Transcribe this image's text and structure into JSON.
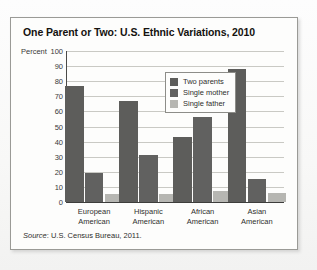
{
  "figure": {
    "title": "One Parent or Two: U.S. Ethnic Variations, 2010",
    "axis_caption": "Percent",
    "source_word": "Source",
    "source_text": ": U.S. Census Bureau, 2011."
  },
  "colors": {
    "two_parents": "#5d5d5b",
    "single_mother": "#616160",
    "single_father": "#b6b6b2",
    "gridline": "#c9c9c4",
    "axis": "#3d3d3b",
    "frame": "#9a9a96"
  },
  "chart_data": {
    "type": "bar",
    "title": "One Parent or Two: U.S. Ethnic Variations, 2010",
    "xlabel": "",
    "ylabel": "Percent",
    "ylim": [
      0,
      100
    ],
    "yticks": [
      100,
      90,
      80,
      70,
      60,
      50,
      40,
      30,
      20,
      10,
      0
    ],
    "grid": true,
    "legend_position": "top-center",
    "categories": [
      "European American",
      "Hispanic American",
      "African American",
      "Asian American"
    ],
    "category_lines": [
      [
        "European",
        "American"
      ],
      [
        "Hispanic",
        "American"
      ],
      [
        "African",
        "American"
      ],
      [
        "Asian",
        "American"
      ]
    ],
    "series": [
      {
        "name": "Two parents",
        "values": [
          77,
          67,
          43,
          88
        ]
      },
      {
        "name": "Single mother",
        "values": [
          19,
          31,
          56,
          15
        ]
      },
      {
        "name": "Single father",
        "values": [
          5,
          5,
          7,
          6
        ]
      }
    ],
    "annotation": "Source: U.S. Census Bureau, 2011."
  }
}
